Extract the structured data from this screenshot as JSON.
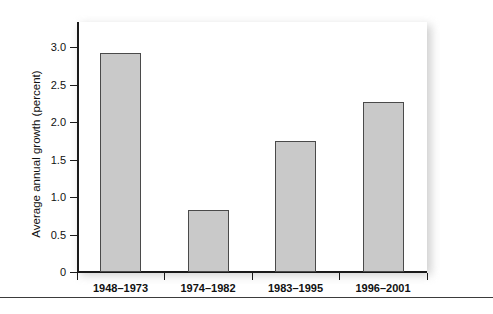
{
  "chart_data": {
    "type": "bar",
    "title": "",
    "xlabel": "",
    "ylabel": "Average annual growth (percent)",
    "categories": [
      "1948–1973",
      "1974–1982",
      "1983–1995",
      "1996–2001"
    ],
    "values": [
      2.92,
      0.83,
      1.75,
      2.27
    ],
    "ylim": [
      0,
      3.25
    ],
    "yticks": [
      "0",
      "0.5",
      "1.0",
      "1.5",
      "2.0",
      "2.5",
      "3.0"
    ],
    "ytick_values": [
      0,
      0.5,
      1.0,
      1.5,
      2.0,
      2.5,
      3.0
    ],
    "grid": false,
    "legend": null,
    "series": [
      {
        "name": "Average annual growth",
        "values": [
          2.92,
          0.83,
          1.75,
          2.27
        ]
      }
    ]
  },
  "style": {
    "bar_fill": "#c9c9c9",
    "bar_stroke": "#4a4a4a",
    "axis_color": "#1a1a1a",
    "text_color": "#111111",
    "plot_background": "#ffffff",
    "rule_color": "#3b3b3b"
  }
}
